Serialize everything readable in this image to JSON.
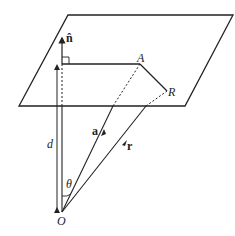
{
  "diagram": {
    "type": "geometry",
    "labels": {
      "normal": "n̂",
      "point_a": "A",
      "point_r": "R",
      "distance": "d",
      "vector_a": "a",
      "vector_r": "r",
      "angle": "θ",
      "origin": "O"
    },
    "colors": {
      "stroke": "#222222",
      "background": "#ffffff"
    }
  }
}
